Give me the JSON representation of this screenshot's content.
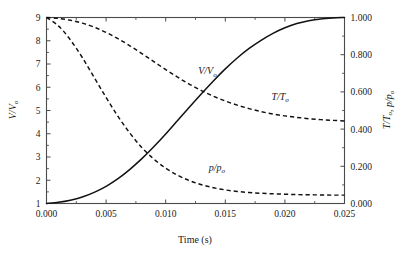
{
  "figure": {
    "background": "#ffffff",
    "ink": "#111111",
    "axis_color": "#4a4a4a"
  },
  "chart_data": {
    "type": "line",
    "title": "",
    "subtitle": "",
    "xlabel": "Time (s)",
    "ylabel": "V/V₀",
    "ylabel_right": "T/T₀, p/p₀",
    "grid": false,
    "legend": "inline-annotations",
    "xlim": [
      0.0,
      0.025
    ],
    "ylim_left": [
      1,
      9
    ],
    "ylim_right": [
      0.0,
      1.0
    ],
    "xticks": [
      0.0,
      0.005,
      0.01,
      0.015,
      0.02,
      0.025
    ],
    "xticklabels": [
      "0.000",
      "0.005",
      "0.010",
      "0.015",
      "0.020",
      "0.025"
    ],
    "yticks_left": [
      1,
      2,
      3,
      4,
      5,
      6,
      7,
      8,
      9
    ],
    "yticklabels_left": [
      "1",
      "2",
      "3",
      "4",
      "5",
      "6",
      "7",
      "8",
      "9"
    ],
    "yticks_right": [
      0.0,
      0.2,
      0.4,
      0.6,
      0.8,
      1.0
    ],
    "yticklabels_right": [
      "0.000",
      "0.200",
      "0.400",
      "0.600",
      "0.800",
      "1.000"
    ],
    "yminor_right": [
      0.1,
      0.3,
      0.5,
      0.7,
      0.9
    ],
    "x": [
      0.0,
      0.001,
      0.002,
      0.003,
      0.004,
      0.005,
      0.006,
      0.007,
      0.008,
      0.009,
      0.01,
      0.011,
      0.012,
      0.013,
      0.014,
      0.015,
      0.016,
      0.017,
      0.018,
      0.019,
      0.02,
      0.021,
      0.022,
      0.023,
      0.024,
      0.025
    ],
    "series": [
      {
        "name": "V/V₀",
        "axis": "left",
        "style": "solid",
        "label": "V/V₀",
        "label_x": 0.0135,
        "label_y": 6.55,
        "values": [
          1.0,
          1.05,
          1.14,
          1.28,
          1.48,
          1.74,
          2.07,
          2.47,
          2.93,
          3.44,
          3.99,
          4.57,
          5.15,
          5.72,
          6.27,
          6.79,
          7.26,
          7.67,
          8.02,
          8.32,
          8.56,
          8.74,
          8.86,
          8.94,
          8.98,
          9.0
        ]
      },
      {
        "name": "T/T₀",
        "axis": "right",
        "style": "dashed",
        "label": "T/T₀",
        "label_x": 0.0196,
        "label_y": 0.555,
        "values": [
          1.0,
          0.995,
          0.985,
          0.97,
          0.948,
          0.92,
          0.886,
          0.848,
          0.806,
          0.763,
          0.72,
          0.679,
          0.641,
          0.607,
          0.577,
          0.551,
          0.529,
          0.51,
          0.494,
          0.481,
          0.471,
          0.463,
          0.456,
          0.451,
          0.447,
          0.444
        ]
      },
      {
        "name": "p/p₀",
        "axis": "right",
        "style": "dashed",
        "label": "p/p₀",
        "label_x": 0.0143,
        "label_y": 0.175,
        "values": [
          1.0,
          0.955,
          0.88,
          0.785,
          0.678,
          0.57,
          0.468,
          0.378,
          0.301,
          0.239,
          0.19,
          0.152,
          0.123,
          0.101,
          0.085,
          0.073,
          0.065,
          0.059,
          0.055,
          0.052,
          0.05,
          0.048,
          0.047,
          0.046,
          0.045,
          0.045
        ]
      }
    ]
  }
}
